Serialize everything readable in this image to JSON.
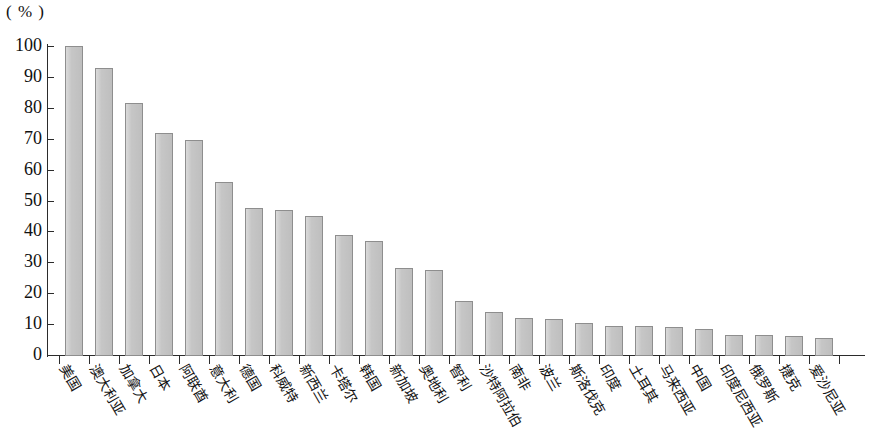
{
  "chart_data": {
    "type": "bar",
    "title": "",
    "subtitle": "",
    "xlabel": "",
    "ylabel": "",
    "unit_label": "( % )",
    "ylim": [
      0,
      100
    ],
    "ytick_labels": [
      "100",
      "90",
      "80",
      "70",
      "60",
      "50",
      "40",
      "30",
      "20",
      "10",
      "0"
    ],
    "ytick_values": [
      100,
      90,
      80,
      70,
      60,
      50,
      40,
      30,
      20,
      10,
      0
    ],
    "grid": false,
    "legend": false,
    "legend_position": "none",
    "bar_fill_color": "#c6c6c6",
    "bar_border_color": "#8e8e8e",
    "axis_color": "#2b2b2b",
    "categories": [
      "美国",
      "澳大利亚",
      "加拿大",
      "日本",
      "阿联酋",
      "意大利",
      "德国",
      "科威特",
      "新西兰",
      "卡塔尔",
      "韩国",
      "新加坡",
      "奥地利",
      "智利",
      "沙特阿拉伯",
      "南非",
      "波兰",
      "斯洛伐克",
      "印度",
      "土耳其",
      "马来西亚",
      "中国",
      "印度尼西亚",
      "俄罗斯",
      "捷克",
      "爱沙尼亚"
    ],
    "values": [
      100,
      93,
      81.5,
      72,
      69.5,
      56,
      47.5,
      47,
      45,
      39,
      37,
      28,
      27.5,
      17.5,
      14,
      12,
      11.5,
      10.5,
      9.5,
      9.3,
      9,
      8.5,
      6.5,
      6.5,
      6,
      5.5
    ]
  }
}
